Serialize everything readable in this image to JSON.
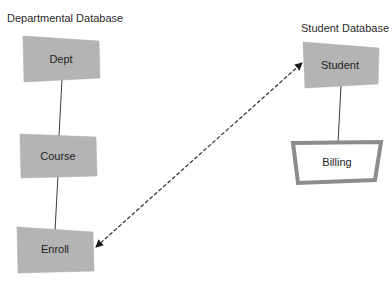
{
  "diagram": {
    "groups": [
      {
        "id": "departmental",
        "title": "Departmental Database"
      },
      {
        "id": "student",
        "title": "Student Database"
      }
    ],
    "nodes": [
      {
        "id": "dept",
        "label": "Dept",
        "group": "departmental",
        "style": "filled"
      },
      {
        "id": "course",
        "label": "Course",
        "group": "departmental",
        "style": "filled"
      },
      {
        "id": "enroll",
        "label": "Enroll",
        "group": "departmental",
        "style": "filled"
      },
      {
        "id": "student",
        "label": "Student",
        "group": "student",
        "style": "filled"
      },
      {
        "id": "billing",
        "label": "Billing",
        "group": "student",
        "style": "outlined"
      }
    ],
    "edges": [
      {
        "from": "dept",
        "to": "course",
        "style": "solid"
      },
      {
        "from": "course",
        "to": "enroll",
        "style": "solid"
      },
      {
        "from": "student",
        "to": "billing",
        "style": "solid"
      },
      {
        "from": "enroll",
        "to": "student",
        "style": "dashed",
        "arrows": "both"
      }
    ],
    "colors": {
      "node_fill": "#b4b4b4",
      "node_border": "#8c8c8c",
      "line": "#3a3a3a",
      "text": "#222222"
    }
  }
}
